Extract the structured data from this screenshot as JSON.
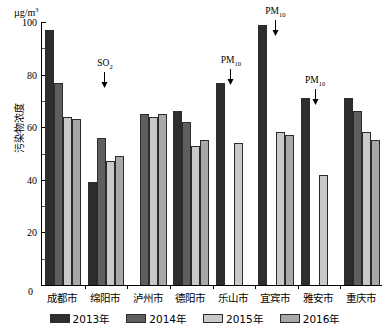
{
  "chart_data": {
    "type": "bar",
    "title": "",
    "xlabel": "",
    "ylabel": "污染物浓度",
    "unit": "µg/m",
    "unit_exp": "3",
    "ylim": [
      0,
      100
    ],
    "yticks": [
      0,
      20,
      40,
      60,
      80,
      100
    ],
    "ytick_labels": [
      "0",
      "20",
      "40",
      "60",
      "80",
      "100"
    ],
    "grid": false,
    "legend_position": "bottom",
    "categories": [
      "成都市",
      "绵阳市",
      "泸州市",
      "德阳市",
      "乐山市",
      "宜宾市",
      "雅安市",
      "重庆市"
    ],
    "series": [
      {
        "name": "2013年",
        "color": "#2e2e2e",
        "values": [
          97,
          39,
          null,
          66,
          77,
          99,
          71,
          71
        ]
      },
      {
        "name": "2014年",
        "color": "#5f5f5f",
        "values": [
          77,
          56,
          65,
          62,
          null,
          null,
          null,
          66
        ]
      },
      {
        "name": "2015年",
        "color": "#c9c9c9",
        "values": [
          64,
          47,
          64,
          53,
          54,
          58,
          42,
          58
        ]
      },
      {
        "name": "2016年",
        "color": "#a8a8a8",
        "values": [
          63,
          49,
          65,
          55,
          null,
          57,
          null,
          55
        ]
      }
    ],
    "annotations": [
      {
        "text": "SO",
        "sub": "2",
        "category": "绵阳市"
      },
      {
        "text": "PM",
        "sub": "10",
        "category": "乐山市"
      },
      {
        "text": "PM",
        "sub": "10",
        "category": "宜宾市"
      },
      {
        "text": "PM",
        "sub": "10",
        "category": "雅安市"
      }
    ]
  }
}
